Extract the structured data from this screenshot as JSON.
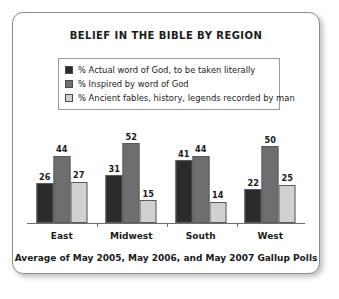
{
  "chart_data": {
    "type": "bar",
    "title": "BELIEF IN THE BIBLE BY REGION",
    "xlabel": "",
    "ylabel": "",
    "ylim": [
      0,
      60
    ],
    "grid": false,
    "legend_position": "top-center",
    "footnote": "Average of May 2005, May 2006, and May 2007 Gallup Polls",
    "categories": [
      "East",
      "Midwest",
      "South",
      "West"
    ],
    "series": [
      {
        "name": "% Actual word of God, to be taken literally",
        "color": "#2b2b2b",
        "values": [
          26,
          31,
          41,
          22
        ]
      },
      {
        "name": "% Inspired by word of God",
        "color": "#6e6e6e",
        "values": [
          44,
          52,
          44,
          50
        ]
      },
      {
        "name": "% Ancient fables, history, legends recorded by man",
        "color": "#d0d0d0",
        "values": [
          27,
          15,
          14,
          25
        ]
      }
    ]
  }
}
